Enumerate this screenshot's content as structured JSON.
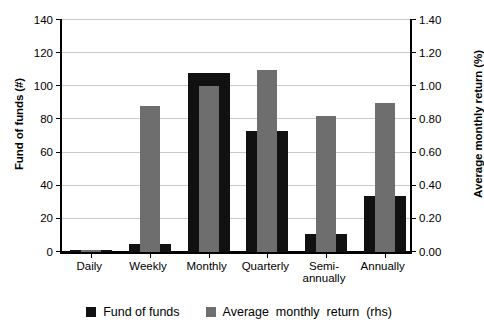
{
  "chart_data": {
    "type": "bar",
    "title": "",
    "categories": [
      "Daily",
      "Weekly",
      "Monthly",
      "Quarterly",
      "Semi-\nannually",
      "Annually"
    ],
    "series": [
      {
        "name": "Fund of funds",
        "axis": "left",
        "color": "#111111",
        "values": [
          1,
          5,
          108,
          73,
          11,
          34
        ]
      },
      {
        "name": "Average  monthly  return  (rhs)",
        "axis": "right",
        "color": "#6e6e6e",
        "values": [
          0.01,
          0.88,
          1.0,
          1.1,
          0.82,
          0.9
        ]
      }
    ],
    "xlabel": "",
    "ylabel": "Fund of funds (#)",
    "ylabel_right": "Average monthly return (%)",
    "ylim": [
      0,
      140
    ],
    "ylim_right": [
      0.0,
      1.4
    ],
    "yticks": [
      "0",
      "20",
      "40",
      "60",
      "80",
      "100",
      "120",
      "140"
    ],
    "yticks_right": [
      "0.00",
      "0.20",
      "0.40",
      "0.60",
      "0.80",
      "1.00",
      "1.20",
      "1.40"
    ],
    "grid": true,
    "legend_position": "bottom"
  },
  "legend": {
    "items": [
      {
        "label": "Fund of funds",
        "swatch": "black-square-icon"
      },
      {
        "label": "Average  monthly  return  (rhs)",
        "swatch": "gray-square-icon"
      }
    ]
  }
}
